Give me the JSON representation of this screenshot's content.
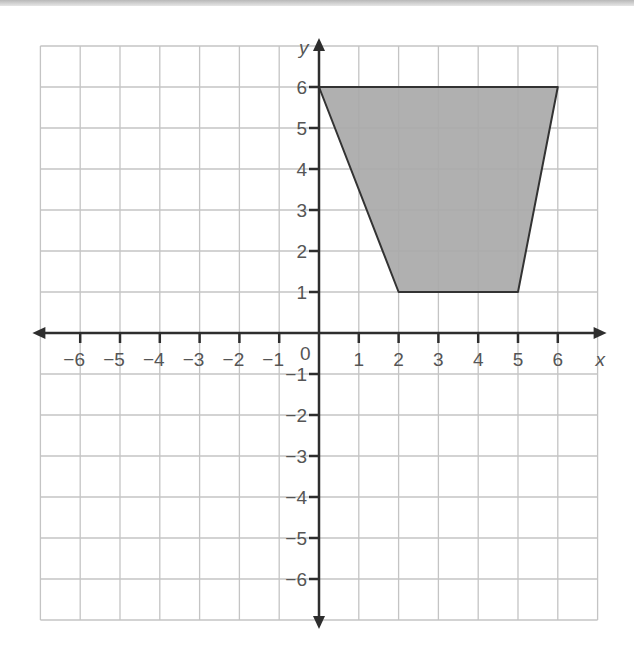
{
  "chart_data": {
    "type": "polygon",
    "title": "",
    "xlabel": "x",
    "ylabel": "y",
    "origin_label": "0",
    "xlim": [
      -7,
      7
    ],
    "ylim": [
      -7,
      7
    ],
    "grid": true,
    "x_ticks": [
      -6,
      -5,
      -4,
      -3,
      -2,
      -1,
      1,
      2,
      3,
      4,
      5,
      6
    ],
    "y_ticks": [
      -6,
      -5,
      -4,
      -3,
      -2,
      -1,
      1,
      2,
      3,
      4,
      5,
      6
    ],
    "x_tick_labels": [
      "−6",
      "−5",
      "−4",
      "−3",
      "−2",
      "−1",
      "1",
      "2",
      "3",
      "4",
      "5",
      "6"
    ],
    "y_tick_labels": [
      "−6",
      "−5",
      "−4",
      "−3",
      "−2",
      "−1",
      "1",
      "2",
      "3",
      "4",
      "5",
      "6"
    ],
    "shapes": [
      {
        "name": "shaded-trapezoid",
        "vertices": [
          [
            0,
            6
          ],
          [
            6,
            6
          ],
          [
            5,
            1
          ],
          [
            2,
            1
          ]
        ],
        "fill": "#a9a9a9",
        "stroke": "#333333"
      }
    ],
    "colors": {
      "grid": "#c4c4c4",
      "axis": "#2e2e2e",
      "text": "#555555"
    }
  }
}
